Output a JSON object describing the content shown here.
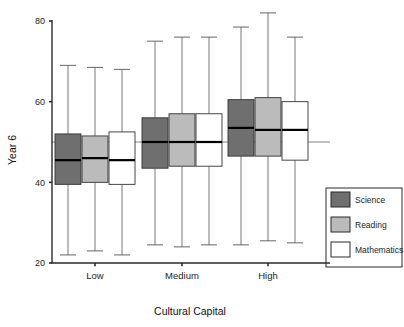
{
  "chart_data": {
    "type": "box",
    "title": "",
    "xlabel": "Cultural Capital",
    "ylabel": "Year 6",
    "categories": [
      "Low",
      "Medium",
      "High"
    ],
    "ylim": [
      20,
      80
    ],
    "yticks": [
      20,
      40,
      60,
      80
    ],
    "ytick_labels": [
      "20",
      "40",
      "60",
      "80"
    ],
    "grid": false,
    "reference_line": {
      "value": 50,
      "label": ""
    },
    "legend": {
      "position": "right-bottom",
      "entries": [
        {
          "name": "Science",
          "color": "#6f6f6f"
        },
        {
          "name": "Reading",
          "color": "#bbbbbb"
        },
        {
          "name": "Mathematics",
          "color": "#ffffff"
        }
      ]
    },
    "series": [
      {
        "name": "Science",
        "color": "#6f6f6f",
        "boxes": [
          {
            "category": "Low",
            "min": 22.0,
            "q1": 39.5,
            "median": 45.5,
            "q3": 52.0,
            "max": 69.0
          },
          {
            "category": "Medium",
            "min": 24.5,
            "q1": 43.5,
            "median": 50.0,
            "q3": 56.0,
            "max": 75.0
          },
          {
            "category": "High",
            "min": 24.5,
            "q1": 46.5,
            "median": 53.5,
            "q3": 60.5,
            "max": 78.5
          }
        ]
      },
      {
        "name": "Reading",
        "color": "#bbbbbb",
        "boxes": [
          {
            "category": "Low",
            "min": 23.0,
            "q1": 40.0,
            "median": 46.0,
            "q3": 51.5,
            "max": 68.5
          },
          {
            "category": "Medium",
            "min": 24.0,
            "q1": 44.0,
            "median": 50.0,
            "q3": 57.0,
            "max": 76.0
          },
          {
            "category": "High",
            "min": 25.5,
            "q1": 46.5,
            "median": 53.0,
            "q3": 61.0,
            "max": 82.0
          }
        ]
      },
      {
        "name": "Mathematics",
        "color": "#ffffff",
        "boxes": [
          {
            "category": "Low",
            "min": 22.0,
            "q1": 39.5,
            "median": 45.5,
            "q3": 52.5,
            "max": 68.0
          },
          {
            "category": "Medium",
            "min": 24.5,
            "q1": 44.0,
            "median": 50.0,
            "q3": 57.0,
            "max": 76.0
          },
          {
            "category": "High",
            "min": 25.0,
            "q1": 45.5,
            "median": 53.0,
            "q3": 60.0,
            "max": 76.0
          }
        ]
      }
    ]
  },
  "layout": {
    "plot_left": 52,
    "plot_right": 330,
    "plot_top": 21,
    "plot_bottom": 263,
    "group_centers": [
      95,
      182,
      268
    ],
    "box_width": 26,
    "box_gap": 1,
    "legend_x": 329,
    "legend_y": 196,
    "legend_row_h": 25,
    "legend_swatch": 19
  },
  "colors": {
    "axis": "#2a2a2a",
    "box_stroke": "#333333",
    "whisker": "#555555",
    "median": "#000000",
    "reference": "#777777",
    "science": "#6f6f6f",
    "reading": "#bbbbbb",
    "mathematics": "#ffffff",
    "background": "#ffffff"
  }
}
